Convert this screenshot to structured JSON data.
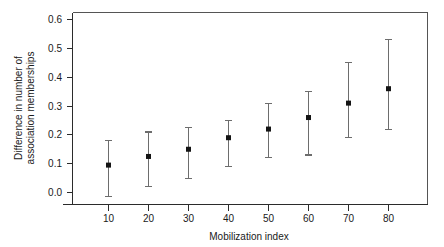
{
  "chart_data": {
    "type": "scatter",
    "title": "",
    "xlabel": "Mobilization index",
    "ylabel": "Difference in number of association memberships",
    "ylabel_lines": [
      "Difference in number of",
      "association memberships"
    ],
    "x": [
      10,
      20,
      30,
      40,
      50,
      60,
      70,
      80
    ],
    "xtick_labels": [
      "10",
      "20",
      "30",
      "40",
      "50",
      "60",
      "70",
      "80"
    ],
    "ytick_labels": [
      "0.0",
      "0.1",
      "0.2",
      "0.3",
      "0.4",
      "0.5",
      "0.6"
    ],
    "yticks": [
      0.0,
      0.1,
      0.2,
      0.3,
      0.4,
      0.5,
      0.6
    ],
    "xlim": [
      4,
      88
    ],
    "ylim": [
      -0.04,
      0.62
    ],
    "grid": false,
    "legend": null,
    "series": [
      {
        "name": "Difference in number of association memberships",
        "values": [
          0.095,
          0.125,
          0.15,
          0.19,
          0.22,
          0.26,
          0.31,
          0.36
        ],
        "error_low": [
          -0.015,
          0.02,
          0.05,
          0.09,
          0.12,
          0.13,
          0.19,
          0.22
        ],
        "error_high": [
          0.18,
          0.21,
          0.225,
          0.25,
          0.31,
          0.35,
          0.45,
          0.53
        ],
        "marker": "square",
        "marker_color": "#141414",
        "errorbar_color": "#6d6d6d"
      }
    ]
  },
  "colors": {
    "background": "#ffffff",
    "axis": "#2b2b2b",
    "frame": "#555555",
    "marker": "#141414",
    "errorbar": "#6d6d6d",
    "text": "#1a1a1a"
  }
}
